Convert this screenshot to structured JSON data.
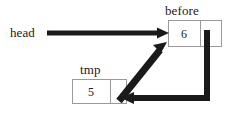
{
  "diagram": {
    "type": "linked-list-pointer-diagram",
    "background_color": "#ffffff",
    "stroke_color": "#1a1a1a",
    "box_border_color": "#9a9a9a",
    "nodes": [
      {
        "id": "before",
        "label": "before",
        "value": "6",
        "pointer_cell": "",
        "x": 168,
        "y": 20,
        "width": 54,
        "height": 27,
        "divider_x": 200,
        "label_x": 165,
        "label_y": 4
      },
      {
        "id": "tmp",
        "label": "tmp",
        "value": "5",
        "pointer_cell": "",
        "x": 72,
        "y": 79,
        "width": 55,
        "height": 25,
        "divider_x": 110,
        "label_x": 80,
        "label_y": 63
      }
    ],
    "variables": [
      {
        "id": "head",
        "label": "head",
        "x": 10,
        "y": 26
      }
    ],
    "arrows": [
      {
        "id": "head-to-before",
        "from": "head",
        "to": "before",
        "shape": "horizontal",
        "points": "47,33 166,33",
        "thickness": 5,
        "arrowhead": "right"
      },
      {
        "id": "tmp-next-to-before",
        "from": "tmp",
        "to": "before",
        "shape": "diagonal",
        "points": "119,101 164,45",
        "thickness": 7,
        "arrowhead": "up-right"
      },
      {
        "id": "before-next-to-tmp",
        "from": "before",
        "to": "tmp",
        "shape": "elbow",
        "points": "207,30 207,98 124,98",
        "thickness": 6,
        "arrowhead": "left"
      }
    ]
  }
}
